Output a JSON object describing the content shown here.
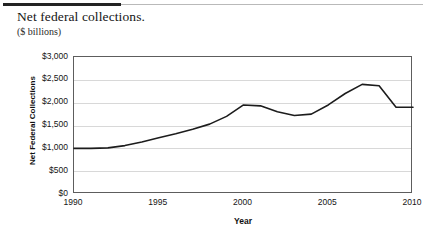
{
  "header": {
    "title": "Net federal collections.",
    "subtitle": "($ billions)"
  },
  "chart_data": {
    "type": "line",
    "title": "Net federal collections.",
    "subtitle": "($ billions)",
    "xlabel": "Year",
    "ylabel": "Net Federal Collections",
    "xlim": [
      1990,
      2010
    ],
    "ylim": [
      0,
      3000
    ],
    "grid": true,
    "legend": "none",
    "line_color": "#1c1c1c",
    "x_ticks": [
      "1990",
      "1995",
      "2000",
      "2005",
      "2010"
    ],
    "x_tick_values": [
      1990,
      1995,
      2000,
      2005,
      2010
    ],
    "y_ticks": [
      "$0",
      "$500",
      "$1,000",
      "$1,500",
      "$2,000",
      "$2,500",
      "$3,000"
    ],
    "y_tick_values": [
      0,
      500,
      1000,
      1500,
      2000,
      2500,
      3000
    ],
    "x": [
      1990,
      1991,
      1992,
      1993,
      1994,
      1995,
      1996,
      1997,
      1998,
      1999,
      2000,
      2001,
      2002,
      2003,
      2004,
      2005,
      2006,
      2007,
      2008,
      2009,
      2010
    ],
    "values": [
      1000,
      1000,
      1010,
      1060,
      1140,
      1230,
      1320,
      1420,
      1530,
      1700,
      1950,
      1930,
      1800,
      1720,
      1750,
      1950,
      2200,
      2400,
      2370,
      1900,
      1900
    ],
    "series": [
      {
        "name": "Net Federal Collections",
        "values": [
          1000,
          1000,
          1010,
          1060,
          1140,
          1230,
          1320,
          1420,
          1530,
          1700,
          1950,
          1930,
          1800,
          1720,
          1750,
          1950,
          2200,
          2400,
          2370,
          1900,
          1900
        ]
      }
    ]
  }
}
